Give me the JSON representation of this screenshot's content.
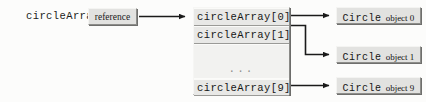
{
  "diagram": {
    "variable_label": "circleArray",
    "reference_box_label": "reference",
    "array": {
      "cells": [
        {
          "label": "circleArray[0]",
          "kind": "element"
        },
        {
          "label": "circleArray[1]",
          "kind": "element"
        },
        {
          "label": "...",
          "kind": "ellipsis"
        },
        {
          "label": "circleArray[9]",
          "kind": "element"
        }
      ]
    },
    "objects": [
      {
        "class_name": "Circle",
        "suffix": "object 0"
      },
      {
        "class_name": "Circle",
        "suffix": "object 1"
      },
      {
        "class_name": "Circle",
        "suffix": "object 9"
      }
    ]
  },
  "colors": {
    "page_background": "#fcfcfb",
    "box_fill": "#e2e2e0",
    "array_fill": "#ececea",
    "gap_fill": "#f2f2f0",
    "highlight_edge": "#f4f4f2",
    "shadow_edge": "#8d8d8a",
    "drop_shadow": "#6f6f6d",
    "line_color": "#1a1a1a",
    "text_color": "#161616"
  }
}
